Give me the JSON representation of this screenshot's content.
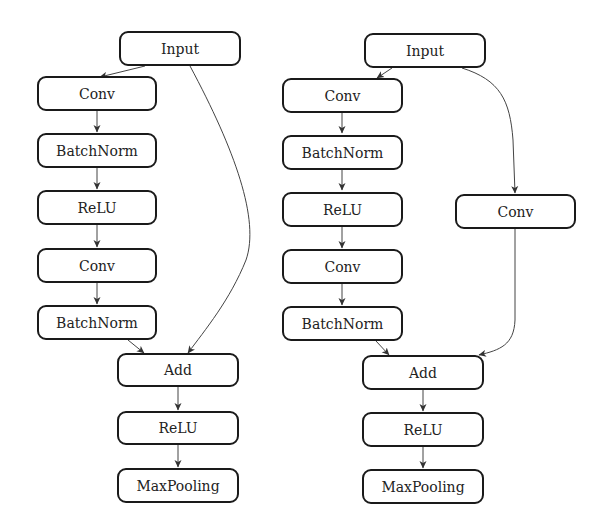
{
  "diagrams": [
    {
      "name": "residual-block-identity-shortcut",
      "nodes": [
        {
          "id": "input",
          "label": "Input"
        },
        {
          "id": "conv1",
          "label": "Conv"
        },
        {
          "id": "bn1",
          "label": "BatchNorm"
        },
        {
          "id": "relu1",
          "label": "ReLU"
        },
        {
          "id": "conv2",
          "label": "Conv"
        },
        {
          "id": "bn2",
          "label": "BatchNorm"
        },
        {
          "id": "add",
          "label": "Add"
        },
        {
          "id": "relu2",
          "label": "ReLU"
        },
        {
          "id": "maxpool",
          "label": "MaxPooling"
        }
      ],
      "edges": [
        [
          "input",
          "conv1"
        ],
        [
          "conv1",
          "bn1"
        ],
        [
          "bn1",
          "relu1"
        ],
        [
          "relu1",
          "conv2"
        ],
        [
          "conv2",
          "bn2"
        ],
        [
          "bn2",
          "add"
        ],
        [
          "input",
          "add"
        ],
        [
          "add",
          "relu2"
        ],
        [
          "relu2",
          "maxpool"
        ]
      ]
    },
    {
      "name": "residual-block-projection-shortcut",
      "nodes": [
        {
          "id": "input",
          "label": "Input"
        },
        {
          "id": "conv1",
          "label": "Conv"
        },
        {
          "id": "bn1",
          "label": "BatchNorm"
        },
        {
          "id": "relu1",
          "label": "ReLU"
        },
        {
          "id": "conv2",
          "label": "Conv"
        },
        {
          "id": "bn2",
          "label": "BatchNorm"
        },
        {
          "id": "shortcut_conv",
          "label": "Conv"
        },
        {
          "id": "add",
          "label": "Add"
        },
        {
          "id": "relu2",
          "label": "ReLU"
        },
        {
          "id": "maxpool",
          "label": "MaxPooling"
        }
      ],
      "edges": [
        [
          "input",
          "conv1"
        ],
        [
          "conv1",
          "bn1"
        ],
        [
          "bn1",
          "relu1"
        ],
        [
          "relu1",
          "conv2"
        ],
        [
          "conv2",
          "bn2"
        ],
        [
          "bn2",
          "add"
        ],
        [
          "input",
          "shortcut_conv"
        ],
        [
          "shortcut_conv",
          "add"
        ],
        [
          "add",
          "relu2"
        ],
        [
          "relu2",
          "maxpool"
        ]
      ]
    }
  ]
}
